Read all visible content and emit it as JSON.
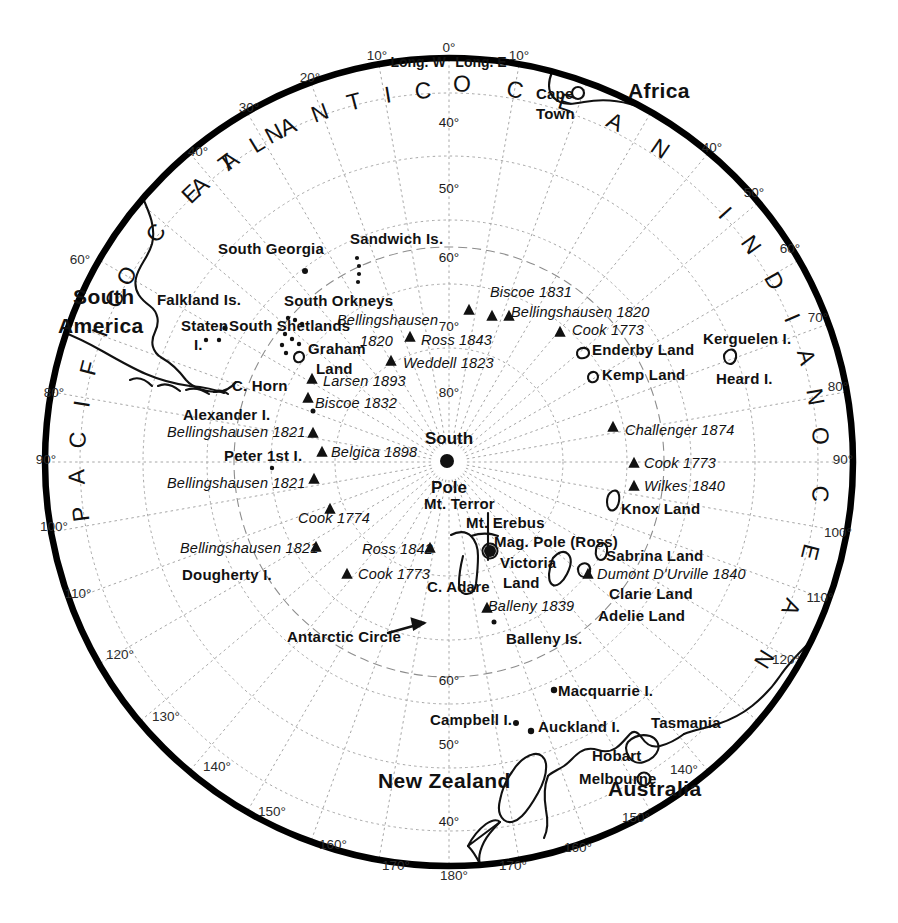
{
  "map": {
    "title": "Antarctic polar projection map",
    "center_label_line1": "South",
    "center_label_line2": "Pole",
    "hemisphere_headers": [
      {
        "text": "Long. W",
        "x": 418,
        "y": 62
      },
      {
        "text": "Long. E",
        "x": 481,
        "y": 62
      }
    ],
    "colors": {
      "ink": "#111111",
      "grid": "#9a9a9a",
      "paper": "#ffffff",
      "rim": "#000000"
    }
  },
  "geometry": {
    "cx": 449,
    "cy": 462,
    "rim_radius": 407,
    "lat_radius": {
      "40": 369,
      "50": 306,
      "60": 242,
      "70": 178,
      "80": 114,
      "antarctic_circle": 215
    }
  },
  "oceans": [
    {
      "name": "ATLANTIC",
      "letters": "ATLANTIC",
      "arc_start_deg": 318,
      "arc_end_deg": 356,
      "radius": 372
    },
    {
      "name": "OCEAN_atlantic",
      "letters": "OCEAN",
      "arc_start_deg": 2,
      "arc_end_deg": 34,
      "radius": 378
    },
    {
      "name": "INDIAN",
      "letters": "INDIAN",
      "arc_start_deg": 48,
      "arc_end_deg": 80,
      "radius": 372
    },
    {
      "name": "OCEAN_indian",
      "letters": "OCEAN",
      "arc_start_deg": 86,
      "arc_end_deg": 122,
      "radius": 372
    },
    {
      "name": "PACIFIC",
      "letters": "PACIFIC",
      "arc_start_deg": 262,
      "arc_end_deg": 296,
      "radius": 372
    },
    {
      "name": "OCEAN_pacific",
      "letters": "OCEAN",
      "arc_start_deg": 300,
      "arc_end_deg": 332,
      "radius": 372
    }
  ],
  "longitude_labels": [
    {
      "text": "0°",
      "x": 449,
      "y": 48
    },
    {
      "text": "10°",
      "x": 377,
      "y": 56
    },
    {
      "text": "10°",
      "x": 519,
      "y": 56
    },
    {
      "text": "20°",
      "x": 310,
      "y": 78
    },
    {
      "text": "30°",
      "x": 249,
      "y": 108
    },
    {
      "text": "40°",
      "x": 198,
      "y": 152
    },
    {
      "text": "40°",
      "x": 712,
      "y": 148
    },
    {
      "text": "50°",
      "x": 754,
      "y": 193
    },
    {
      "text": "60°",
      "x": 80,
      "y": 260
    },
    {
      "text": "60°",
      "x": 790,
      "y": 249
    },
    {
      "text": "70°",
      "x": 818,
      "y": 318
    },
    {
      "text": "80°",
      "x": 54,
      "y": 393
    },
    {
      "text": "80°",
      "x": 838,
      "y": 387
    },
    {
      "text": "90°",
      "x": 46,
      "y": 460
    },
    {
      "text": "90°",
      "x": 843,
      "y": 460
    },
    {
      "text": "100°",
      "x": 54,
      "y": 527
    },
    {
      "text": "100°",
      "x": 838,
      "y": 533
    },
    {
      "text": "110°",
      "x": 78,
      "y": 594
    },
    {
      "text": "110°",
      "x": 820,
      "y": 598
    },
    {
      "text": "120°",
      "x": 120,
      "y": 655
    },
    {
      "text": "120°",
      "x": 786,
      "y": 660
    },
    {
      "text": "130°",
      "x": 166,
      "y": 717
    },
    {
      "text": "140°",
      "x": 217,
      "y": 767
    },
    {
      "text": "140°",
      "x": 684,
      "y": 770
    },
    {
      "text": "150°",
      "x": 272,
      "y": 812
    },
    {
      "text": "150°",
      "x": 636,
      "y": 818
    },
    {
      "text": "160°",
      "x": 333,
      "y": 845
    },
    {
      "text": "160°",
      "x": 578,
      "y": 848
    },
    {
      "text": "170°",
      "x": 396,
      "y": 866
    },
    {
      "text": "170°",
      "x": 513,
      "y": 866
    },
    {
      "text": "180°",
      "x": 454,
      "y": 876
    }
  ],
  "latitude_labels": [
    {
      "text": "40°",
      "x": 449,
      "y": 123
    },
    {
      "text": "50°",
      "x": 449,
      "y": 189
    },
    {
      "text": "60°",
      "x": 449,
      "y": 258
    },
    {
      "text": "70°",
      "x": 449,
      "y": 327
    },
    {
      "text": "80°",
      "x": 449,
      "y": 393
    },
    {
      "text": "60°",
      "x": 449,
      "y": 681
    },
    {
      "text": "50°",
      "x": 449,
      "y": 745
    },
    {
      "text": "40°",
      "x": 449,
      "y": 822
    }
  ],
  "places": [
    {
      "name": "Africa",
      "text": "Africa",
      "x": 628,
      "y": 90,
      "style": "place-big",
      "anchor": "left"
    },
    {
      "name": "Cape Town",
      "text": "Cape",
      "x": 536,
      "y": 93,
      "style": "place",
      "anchor": "left"
    },
    {
      "name": "Cape Town 2",
      "text": "Town",
      "x": 536,
      "y": 113,
      "style": "place",
      "anchor": "left"
    },
    {
      "name": "South America 1",
      "text": "South",
      "x": 73,
      "y": 296,
      "style": "place-big",
      "anchor": "left"
    },
    {
      "name": "South America 2",
      "text": "America",
      "x": 58,
      "y": 325,
      "style": "place-big",
      "anchor": "left"
    },
    {
      "name": "South Georgia",
      "text": "South Georgia",
      "x": 218,
      "y": 248,
      "style": "place",
      "anchor": "left"
    },
    {
      "name": "Sandwich Is.",
      "text": "Sandwich Is.",
      "x": 350,
      "y": 238,
      "style": "place",
      "anchor": "left"
    },
    {
      "name": "Falkland Is.",
      "text": "Falkland Is.",
      "x": 157,
      "y": 299,
      "style": "place",
      "anchor": "left"
    },
    {
      "name": "South Orkneys",
      "text": "South Orkneys",
      "x": 284,
      "y": 300,
      "style": "place",
      "anchor": "left"
    },
    {
      "name": "Staten I. 1",
      "text": "Staten",
      "x": 181,
      "y": 325,
      "style": "place",
      "anchor": "left"
    },
    {
      "name": "Staten I. 2",
      "text": "I.",
      "x": 194,
      "y": 344,
      "style": "place",
      "anchor": "left"
    },
    {
      "name": "South Shetlands",
      "text": "South Shetlands",
      "x": 229,
      "y": 325,
      "style": "place",
      "anchor": "left"
    },
    {
      "name": "Graham Land 1",
      "text": "Graham",
      "x": 308,
      "y": 348,
      "style": "place",
      "anchor": "left"
    },
    {
      "name": "Graham Land 2",
      "text": "Land",
      "x": 316,
      "y": 368,
      "style": "place",
      "anchor": "left"
    },
    {
      "name": "C. Horn",
      "text": "C. Horn",
      "x": 232,
      "y": 385,
      "style": "place",
      "anchor": "left"
    },
    {
      "name": "Alexander I.",
      "text": "Alexander I.",
      "x": 183,
      "y": 414,
      "style": "place",
      "anchor": "left"
    },
    {
      "name": "Peter 1st I.",
      "text": "Peter 1st I.",
      "x": 224,
      "y": 455,
      "style": "place",
      "anchor": "left"
    },
    {
      "name": "Dougherty I.",
      "text": "Dougherty I.",
      "x": 182,
      "y": 574,
      "style": "place",
      "anchor": "left"
    },
    {
      "name": "Enderby Land",
      "text": "Enderby Land",
      "x": 592,
      "y": 349,
      "style": "place",
      "anchor": "left"
    },
    {
      "name": "Kemp Land",
      "text": "Kemp Land",
      "x": 602,
      "y": 374,
      "style": "place",
      "anchor": "left"
    },
    {
      "name": "Kerguelen I.",
      "text": "Kerguelen I.",
      "x": 703,
      "y": 338,
      "style": "place",
      "anchor": "left"
    },
    {
      "name": "Heard I.",
      "text": "Heard I.",
      "x": 716,
      "y": 378,
      "style": "place",
      "anchor": "left"
    },
    {
      "name": "Knox Land",
      "text": "Knox Land",
      "x": 621,
      "y": 508,
      "style": "place",
      "anchor": "left"
    },
    {
      "name": "Sabrina Land",
      "text": "Sabrina Land",
      "x": 606,
      "y": 555,
      "style": "place",
      "anchor": "left"
    },
    {
      "name": "Clarie Land",
      "text": "Clarie Land",
      "x": 609,
      "y": 593,
      "style": "place",
      "anchor": "left"
    },
    {
      "name": "Adelie Land",
      "text": "Adelie Land",
      "x": 598,
      "y": 615,
      "style": "place",
      "anchor": "left"
    },
    {
      "name": "Mt. Terror",
      "text": "Mt. Terror",
      "x": 424,
      "y": 503,
      "style": "place",
      "anchor": "left"
    },
    {
      "name": "Mt. Erebus",
      "text": "Mt. Erebus",
      "x": 466,
      "y": 522,
      "style": "place",
      "anchor": "left"
    },
    {
      "name": "Mag. Pole (Ross)",
      "text": "Mag. Pole (Ross)",
      "x": 494,
      "y": 541,
      "style": "place",
      "anchor": "left"
    },
    {
      "name": "Victoria Land 1",
      "text": "Victoria",
      "x": 500,
      "y": 562,
      "style": "place",
      "anchor": "left"
    },
    {
      "name": "Victoria Land 2",
      "text": "Land",
      "x": 503,
      "y": 582,
      "style": "place",
      "anchor": "left"
    },
    {
      "name": "C. Adare",
      "text": "C. Adare",
      "x": 427,
      "y": 586,
      "style": "place",
      "anchor": "left"
    },
    {
      "name": "Balleny Is.",
      "text": "Balleny Is.",
      "x": 506,
      "y": 638,
      "style": "place",
      "anchor": "left"
    },
    {
      "name": "Macquarrie I.",
      "text": "Macquarrie I.",
      "x": 558,
      "y": 690,
      "style": "place",
      "anchor": "left"
    },
    {
      "name": "Campbell I.",
      "text": "Campbell I.",
      "x": 430,
      "y": 719,
      "style": "place",
      "anchor": "left"
    },
    {
      "name": "Auckland I.",
      "text": "Auckland I.",
      "x": 538,
      "y": 726,
      "style": "place",
      "anchor": "left"
    },
    {
      "name": "Tasmania",
      "text": "Tasmania",
      "x": 651,
      "y": 722,
      "style": "place",
      "anchor": "left"
    },
    {
      "name": "Hobart",
      "text": "Hobart",
      "x": 592,
      "y": 755,
      "style": "place",
      "anchor": "left"
    },
    {
      "name": "Melbourne",
      "text": "Melbourne",
      "x": 579,
      "y": 778,
      "style": "place",
      "anchor": "left"
    },
    {
      "name": "Australia",
      "text": "Australia",
      "x": 608,
      "y": 788,
      "style": "place-big",
      "anchor": "left"
    },
    {
      "name": "New Zealand",
      "text": "New Zealand",
      "x": 378,
      "y": 780,
      "style": "place-big",
      "anchor": "left"
    },
    {
      "name": "Antarctic Circle",
      "text": "Antarctic Circle",
      "x": 287,
      "y": 636,
      "style": "place",
      "anchor": "left"
    }
  ],
  "expeditions": [
    {
      "name": "Biscoe 1831",
      "text": "Biscoe 1831",
      "x": 490,
      "y": 292,
      "marker_x": 469,
      "marker_y": 308
    },
    {
      "name": "Bellingshausen 1820 E",
      "text": "Bellingshausen 1820",
      "x": 511,
      "y": 312,
      "marker_x": 498,
      "marker_y": 316
    },
    {
      "name": "Cook 1773 A",
      "text": "Cook 1773",
      "x": 572,
      "y": 330,
      "marker_x": 560,
      "marker_y": 331
    },
    {
      "name": "Bellingshausen W",
      "text": "Bellingshausen",
      "x": 337,
      "y": 320,
      "marker_x": 0,
      "marker_y": 0
    },
    {
      "name": "Bellingshausen 1820 W",
      "text": "1820",
      "x": 360,
      "y": 341,
      "marker_x": 0,
      "marker_y": 0
    },
    {
      "name": "Ross 1843",
      "text": "Ross 1843",
      "x": 421,
      "y": 340,
      "marker_x": 410,
      "marker_y": 337
    },
    {
      "name": "Weddell 1823",
      "text": "Weddell 1823",
      "x": 403,
      "y": 363,
      "marker_x": 391,
      "marker_y": 360
    },
    {
      "name": "Larsen 1893",
      "text": "Larsen 1893",
      "x": 323,
      "y": 381,
      "marker_x": 312,
      "marker_y": 378
    },
    {
      "name": "Biscoe 1832",
      "text": "Biscoe 1832",
      "x": 315,
      "y": 403,
      "marker_x": 310,
      "marker_y": 397
    },
    {
      "name": "Bellingshausen 1821 a",
      "text": "Bellingshausen 1821",
      "x": 167,
      "y": 432,
      "marker_x": 312,
      "marker_y": 432
    },
    {
      "name": "Belgica 1898",
      "text": "Belgica 1898",
      "x": 331,
      "y": 452,
      "marker_x": 322,
      "marker_y": 452
    },
    {
      "name": "Bellingshausen 1821 b",
      "text": "Bellingshausen 1821",
      "x": 167,
      "y": 483,
      "marker_x": 313,
      "marker_y": 478
    },
    {
      "name": "Cook 1774",
      "text": "Cook 1774",
      "x": 298,
      "y": 518,
      "marker_x": 330,
      "marker_y": 509
    },
    {
      "name": "Bellingshausen 1821 c",
      "text": "Bellingshausen 1821",
      "x": 180,
      "y": 548,
      "marker_x": 315,
      "marker_y": 546
    },
    {
      "name": "Ross 1842",
      "text": "Ross 1842",
      "x": 362,
      "y": 549,
      "marker_x": 430,
      "marker_y": 548
    },
    {
      "name": "Cook 1773 B",
      "text": "Cook 1773",
      "x": 358,
      "y": 574,
      "marker_x": 347,
      "marker_y": 573
    },
    {
      "name": "Balleny 1839",
      "text": "Balleny 1839",
      "x": 488,
      "y": 606,
      "marker_x": 487,
      "marker_y": 607
    },
    {
      "name": "Challenger 1874",
      "text": "Challenger 1874",
      "x": 625,
      "y": 430,
      "marker_x": 613,
      "marker_y": 427
    },
    {
      "name": "Cook 1773 C",
      "text": "Cook 1773",
      "x": 644,
      "y": 463,
      "marker_x": 634,
      "marker_y": 462
    },
    {
      "name": "Wilkes 1840",
      "text": "Wilkes 1840",
      "x": 644,
      "y": 486,
      "marker_x": 634,
      "marker_y": 485
    },
    {
      "name": "Dumont D'Urville 1840",
      "text": "Dumont D'Urville 1840",
      "x": 597,
      "y": 574,
      "marker_x": 588,
      "marker_y": 573
    }
  ],
  "markers": {
    "triangles": [
      {
        "x": 469,
        "y": 310
      },
      {
        "x": 492,
        "y": 316
      },
      {
        "x": 509,
        "y": 316
      },
      {
        "x": 410,
        "y": 337
      },
      {
        "x": 560,
        "y": 332
      },
      {
        "x": 391,
        "y": 361
      },
      {
        "x": 312,
        "y": 379
      },
      {
        "x": 308,
        "y": 398
      },
      {
        "x": 313,
        "y": 433
      },
      {
        "x": 322,
        "y": 452
      },
      {
        "x": 314,
        "y": 479
      },
      {
        "x": 330,
        "y": 509
      },
      {
        "x": 316,
        "y": 547
      },
      {
        "x": 430,
        "y": 548
      },
      {
        "x": 347,
        "y": 574
      },
      {
        "x": 487,
        "y": 608
      },
      {
        "x": 613,
        "y": 427
      },
      {
        "x": 634,
        "y": 463
      },
      {
        "x": 634,
        "y": 486
      },
      {
        "x": 588,
        "y": 574
      }
    ],
    "dots": [
      {
        "x": 447,
        "y": 461,
        "r": 7,
        "name": "south-pole-dot"
      },
      {
        "x": 490,
        "y": 551,
        "r": 6,
        "name": "mag-pole-dot"
      },
      {
        "x": 313,
        "y": 411,
        "r": 2.5,
        "name": "small-isle-1"
      },
      {
        "x": 272,
        "y": 468,
        "r": 2.2,
        "name": "peter-1st-dot"
      },
      {
        "x": 305,
        "y": 271,
        "r": 3,
        "name": "south-georgia-dot"
      },
      {
        "x": 494,
        "y": 622,
        "r": 2.5,
        "name": "balleny-dot"
      },
      {
        "x": 516,
        "y": 723,
        "r": 3,
        "name": "campbell-dot"
      },
      {
        "x": 531,
        "y": 731,
        "r": 3.2,
        "name": "auckland-dot"
      },
      {
        "x": 554,
        "y": 690,
        "r": 3.2,
        "name": "macquarrie-dot"
      }
    ]
  },
  "legend_note": "Historic Antarctic exploration routes and landfalls"
}
